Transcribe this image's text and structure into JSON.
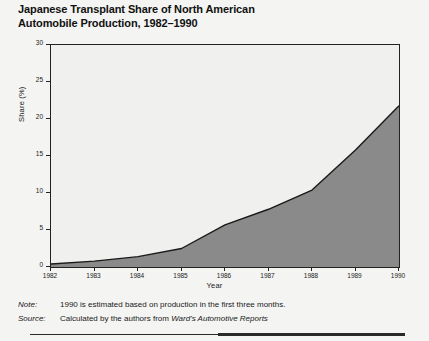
{
  "figure": {
    "title": "Japanese Transplant Share of North American\nAutomobile Production, 1982–1990",
    "note_label": "Note:",
    "note_text": "1990 is estimated based on production in the first three months.",
    "source_label": "Source:",
    "source_text_plain": "Calculated by the authors from ",
    "source_text_italic": "Ward's Automotive Reports"
  },
  "colors": {
    "area_fill": "#8a8a8a",
    "line": "#1a1a1a",
    "axis": "#222222",
    "plot_background": "#f0f0ee",
    "page_background": "#f4f4f2"
  },
  "chart_data": {
    "type": "area",
    "title": "Japanese Transplant Share of North American Automobile Production, 1982–1990",
    "xlabel": "Year",
    "ylabel": "Share (%)",
    "x": [
      1982,
      1983,
      1984,
      1985,
      1986,
      1987,
      1988,
      1989,
      1990
    ],
    "xticklabels": [
      "1982",
      "1983",
      "1984",
      "1985",
      "1986",
      "1987",
      "1988",
      "1989",
      "1990"
    ],
    "values": [
      0.4,
      0.8,
      1.4,
      2.5,
      5.7,
      7.8,
      10.4,
      15.8,
      21.8
    ],
    "yticks": [
      0,
      5,
      10,
      15,
      20,
      25,
      30
    ],
    "yticklabels": [
      "0",
      "5",
      "10",
      "15",
      "20",
      "25",
      "30"
    ],
    "xlim": [
      1982,
      1990
    ],
    "ylim": [
      0,
      30
    ],
    "grid": false,
    "legend": false,
    "series": [
      {
        "name": "Japanese transplant share",
        "values": [
          0.4,
          0.8,
          1.4,
          2.5,
          5.7,
          7.8,
          10.4,
          15.8,
          21.8
        ]
      }
    ]
  }
}
